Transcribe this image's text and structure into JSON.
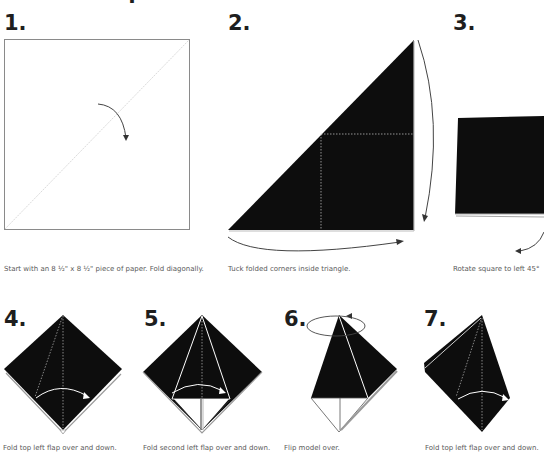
{
  "header": {
    "partial_glyph": "."
  },
  "colors": {
    "paper_dark": "#0d0d0d",
    "outline": "#8a8a8a",
    "crease": "#cfcfcf",
    "arrow": "#444444",
    "caption": "#5a5a5a"
  },
  "steps": [
    {
      "number": "1.",
      "caption": "Start with an 8 ½\" x 8 ½\" piece of paper. Fold diagonally.",
      "icon": "fold-arrow-icon"
    },
    {
      "number": "2.",
      "caption": "Tuck folded corners inside triangle.",
      "icon": "tuck-arrows-icon"
    },
    {
      "number": "3.",
      "caption": "Rotate square to left 45°",
      "icon": "rotate-arrow-icon"
    },
    {
      "number": "4.",
      "caption": "Fold top left flap over and down.",
      "icon": "flap-arrow-icon"
    },
    {
      "number": "5.",
      "caption": "Fold second left flap over and down.",
      "icon": "flap-arrow-icon"
    },
    {
      "number": "6.",
      "caption": "Flip model over.",
      "icon": "flip-arrow-icon"
    },
    {
      "number": "7.",
      "caption": "Fold top left flap over and down.",
      "icon": "flap-arrow-icon"
    }
  ]
}
